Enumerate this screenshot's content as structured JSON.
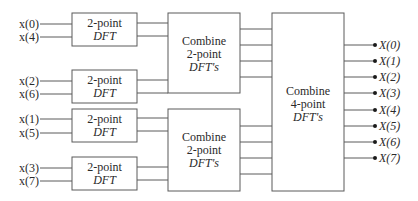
{
  "diagram": {
    "colors": {
      "line": "#5a5a5a",
      "text": "#2a2a2a",
      "background": "#ffffff"
    },
    "stage1": {
      "blocks": [
        {
          "line1": "2-point",
          "line2": "DFT",
          "inputs": [
            "x(0)",
            "x(4)"
          ]
        },
        {
          "line1": "2-point",
          "line2": "DFT",
          "inputs": [
            "x(2)",
            "x(6)"
          ]
        },
        {
          "line1": "2-point",
          "line2": "DFT",
          "inputs": [
            "x(1)",
            "x(5)"
          ]
        },
        {
          "line1": "2-point",
          "line2": "DFT",
          "inputs": [
            "x(3)",
            "x(7)"
          ]
        }
      ]
    },
    "stage2": {
      "blocks": [
        {
          "line1": "Combine",
          "line2": "2-point",
          "line3": "DFT's"
        },
        {
          "line1": "Combine",
          "line2": "2-point",
          "line3": "DFT's"
        }
      ]
    },
    "stage3": {
      "block": {
        "line1": "Combine",
        "line2": "4-point",
        "line3": "DFT's"
      },
      "outputs": [
        "X(0)",
        "X(1)",
        "X(2)",
        "X(3)",
        "X(4)",
        "X(5)",
        "X(6)",
        "X(7)"
      ]
    }
  }
}
